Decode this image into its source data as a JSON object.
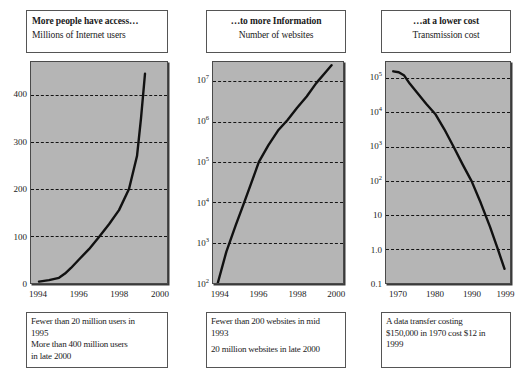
{
  "figure": {
    "panels": [
      {
        "id": "internet-users",
        "header": {
          "title": "More people have access…",
          "subtitle": "Millions of Internet users",
          "align": "left"
        },
        "caption": [
          "Fewer than 20 million users in",
          "1995",
          "More than 400 million users",
          "in late 2000"
        ]
      },
      {
        "id": "websites",
        "header": {
          "title": "…to more Information",
          "subtitle": "Number of websites",
          "align": "center"
        },
        "caption": [
          "Fewer than 200 websites in mid",
          "1993",
          "20 million websites in late 2000"
        ]
      },
      {
        "id": "transmission-cost",
        "header": {
          "title": "…at a lower cost",
          "subtitle": "Transmission cost",
          "align": "center"
        },
        "caption": [
          "A data transfer costing",
          "$150,000 in 1970 cost $12 in",
          "1999"
        ]
      }
    ]
  },
  "chart_data": [
    {
      "type": "line",
      "title": "More people have access…",
      "subtitle": "Millions of Internet users",
      "xlabel": "",
      "ylabel": "Millions of Internet users",
      "xscale": "linear",
      "yscale": "linear",
      "xlim": [
        1993.6,
        2000.4
      ],
      "ylim": [
        0,
        470
      ],
      "grid": true,
      "grid_style": "dashed-horizontal",
      "legend": "none",
      "xticks": [
        "1994",
        "1996",
        "1998",
        "2000"
      ],
      "xtick_values": [
        1994,
        1996,
        1998,
        2000
      ],
      "yticks": [
        "0",
        "100",
        "200",
        "300",
        "400"
      ],
      "ytick_values": [
        0,
        100,
        200,
        300,
        400
      ],
      "series": [
        {
          "name": "Millions of Internet users",
          "color": "#111111",
          "x": [
            1994.0,
            1994.5,
            1995.0,
            1995.3,
            1995.6,
            1996.0,
            1996.5,
            1997.0,
            1997.5,
            1998.0,
            1998.5,
            1998.9,
            1999.1,
            1999.3
          ],
          "y": [
            3,
            6,
            11,
            20,
            32,
            50,
            72,
            98,
            125,
            155,
            200,
            270,
            350,
            445
          ]
        }
      ]
    },
    {
      "type": "line",
      "title": "…to more Information",
      "subtitle": "Number of websites",
      "xlabel": "",
      "ylabel": "Number of websites",
      "xscale": "linear",
      "yscale": "log",
      "xlim": [
        1993.6,
        2000.4
      ],
      "ylim": [
        100,
        30000000
      ],
      "grid": true,
      "grid_style": "dashed-horizontal",
      "legend": "none",
      "xticks": [
        "1994",
        "1996",
        "1998",
        "2000"
      ],
      "xtick_values": [
        1994,
        1996,
        1998,
        2000
      ],
      "yticks": [
        "10^2",
        "10^3",
        "10^4",
        "10^5",
        "10^6",
        "10^7"
      ],
      "ytick_values": [
        100,
        1000,
        10000,
        100000,
        1000000,
        10000000
      ],
      "series": [
        {
          "name": "Number of websites",
          "color": "#111111",
          "x": [
            1993.85,
            1994.3,
            1994.8,
            1995.2,
            1995.6,
            1996.0,
            1996.5,
            1997.0,
            1997.5,
            1998.0,
            1998.5,
            1999.0,
            1999.5,
            1999.8
          ],
          "y": [
            100,
            600,
            2800,
            9000,
            30000,
            100000,
            260000,
            600000,
            1100000,
            2200000,
            4200000,
            9000000,
            17000000,
            25000000
          ]
        }
      ]
    },
    {
      "type": "line",
      "title": "…at a lower cost",
      "subtitle": "Transmission cost",
      "xlabel": "",
      "ylabel": "Transmission cost",
      "xscale": "linear",
      "yscale": "log",
      "xlim": [
        1966.5,
        2000.5
      ],
      "ylim": [
        0.1,
        300000
      ],
      "grid": true,
      "grid_style": "dashed-horizontal",
      "legend": "none",
      "xticks": [
        "1970",
        "1980",
        "1990",
        "1999"
      ],
      "xtick_values": [
        1970,
        1980,
        1990,
        1999
      ],
      "yticks": [
        "0.1",
        "1.0",
        "10",
        "10^2",
        "10^3",
        "10^4",
        "10^5"
      ],
      "ytick_values": [
        0.1,
        1.0,
        10,
        100,
        1000,
        10000,
        100000
      ],
      "series": [
        {
          "name": "Transmission cost",
          "color": "#111111",
          "x": [
            1968.5,
            1970.0,
            1971.5,
            1973.0,
            1975.0,
            1977.5,
            1980.0,
            1982.5,
            1985.0,
            1987.5,
            1990.0,
            1992.5,
            1995.0,
            1997.0,
            1999.0
          ],
          "y": [
            160000,
            150000,
            120000,
            70000,
            38000,
            18000,
            9000,
            3200,
            1000,
            300,
            95,
            22,
            4.5,
            1.1,
            0.26
          ]
        }
      ]
    }
  ],
  "style": {
    "plot_background": "#b5b5b5",
    "curve_color": "#111111",
    "grid_color": "#141414",
    "box_border": "#555555",
    "page_background": "#ffffff"
  }
}
